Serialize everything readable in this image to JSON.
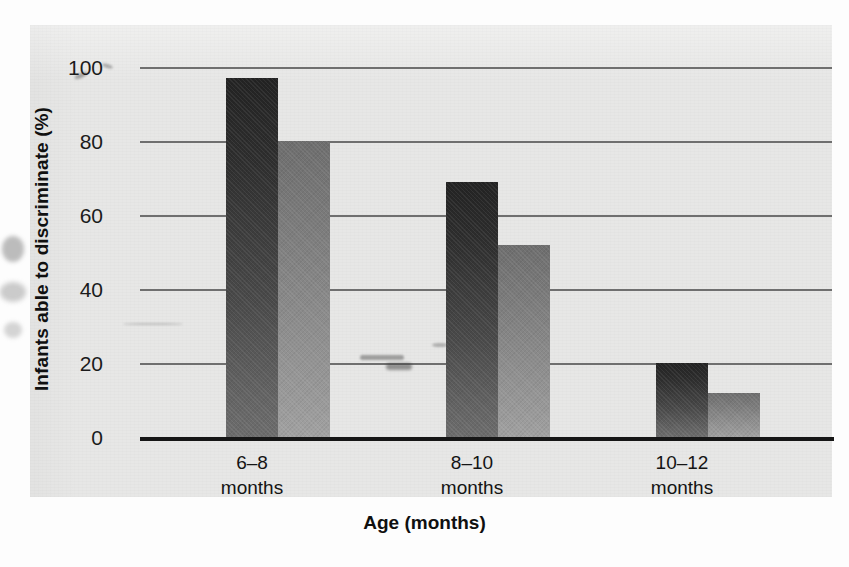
{
  "chart_data": {
    "type": "bar",
    "title": "",
    "subtitle": "",
    "xlabel": "Age (months)",
    "ylabel": "Infants able to discriminate (%)",
    "categories": [
      "6–8\nmonths",
      "8–10\nmonths",
      "10–12\nmonths"
    ],
    "category_lines": [
      [
        "6–8",
        "months"
      ],
      [
        "8–10",
        "months"
      ],
      [
        "10–12",
        "months"
      ]
    ],
    "series": [
      {
        "name": "series-1",
        "color": "#2b2b2b",
        "values": [
          97,
          69,
          20
        ]
      },
      {
        "name": "series-2",
        "color": "#8a8a8a",
        "values": [
          80,
          52,
          12
        ]
      }
    ],
    "ylim": [
      0,
      100
    ],
    "yticks": [
      0,
      20,
      40,
      60,
      80,
      100
    ],
    "ytick_labels": [
      "0",
      "20",
      "40",
      "60",
      "80",
      "100"
    ],
    "grid": true,
    "grid_axis": "y",
    "legend": false,
    "legend_position": "none"
  },
  "axes": {
    "y_tick_0": "0",
    "y_tick_20": "20",
    "y_tick_40": "40",
    "y_tick_60": "60",
    "y_tick_80": "80",
    "y_tick_100": "100",
    "y_title": "Infants able to discriminate (%)",
    "x_title": "Age (months)"
  },
  "xlabels": {
    "g1_top": "6–8",
    "g1_bottom": "months",
    "g2_top": "8–10",
    "g2_bottom": "months",
    "g3_top": "10–12",
    "g3_bottom": "months"
  },
  "colors": {
    "panel_background": "#e7e7e6",
    "gridline": "#6f6f6f",
    "baseline": "#161616",
    "bar_dark_top": "#232323",
    "bar_dark_bottom": "#6d6d6d",
    "bar_light_top": "#6e6e6e",
    "bar_light_bottom": "#a1a1a1",
    "text": "#141414"
  }
}
